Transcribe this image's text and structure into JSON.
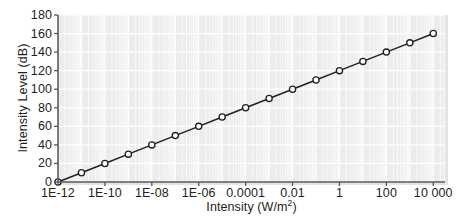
{
  "chart_data": {
    "type": "line",
    "title": "",
    "xlabel": "Intensity (W/m²)",
    "ylabel": "Intensity Level (dB)",
    "xscale": "log",
    "yscale": "linear",
    "xlim": [
      1e-12,
      31622.7766
    ],
    "ylim": [
      0,
      180
    ],
    "grid": true,
    "legend": false,
    "marker": "open-circle",
    "line_color": "#231f20",
    "marker_fill": "#ffffff",
    "plot_background": "#ececec",
    "gridline_color": "#ffffff",
    "x": [
      1e-12,
      1e-11,
      1e-10,
      1e-09,
      1e-08,
      1e-07,
      1e-06,
      1e-05,
      0.0001,
      0.001,
      0.01,
      0.1,
      1,
      10,
      100,
      1000,
      10000
    ],
    "values": [
      0,
      10,
      20,
      30,
      40,
      50,
      60,
      70,
      80,
      90,
      100,
      110,
      120,
      130,
      140,
      150,
      160
    ],
    "series": [
      {
        "name": "Intensity Level",
        "x": [
          1e-12,
          1e-11,
          1e-10,
          1e-09,
          1e-08,
          1e-07,
          1e-06,
          1e-05,
          0.0001,
          0.001,
          0.01,
          0.1,
          1,
          10,
          100,
          1000,
          10000
        ],
        "values": [
          0,
          10,
          20,
          30,
          40,
          50,
          60,
          70,
          80,
          90,
          100,
          110,
          120,
          130,
          140,
          150,
          160
        ]
      }
    ],
    "x_tick_values": [
      1e-12,
      1e-10,
      1e-08,
      1e-06,
      0.0001,
      0.01,
      1,
      100,
      10000
    ],
    "x_tick_labels": [
      "1E-12",
      "1E-10",
      "1E-08",
      "1E-06",
      "0.0001",
      "0.01",
      "1",
      "100",
      "10 000"
    ],
    "y_tick_values": [
      0,
      20,
      40,
      60,
      80,
      100,
      120,
      140,
      160,
      180
    ],
    "y_tick_labels": [
      "0",
      "20",
      "40",
      "60",
      "80",
      "100",
      "120",
      "140",
      "160",
      "180"
    ]
  },
  "axis": {
    "x_title_main": "Intensity (W/m",
    "x_title_sup": "2",
    "x_title_tail": ")",
    "y_title": "Intensity Level (dB)"
  }
}
